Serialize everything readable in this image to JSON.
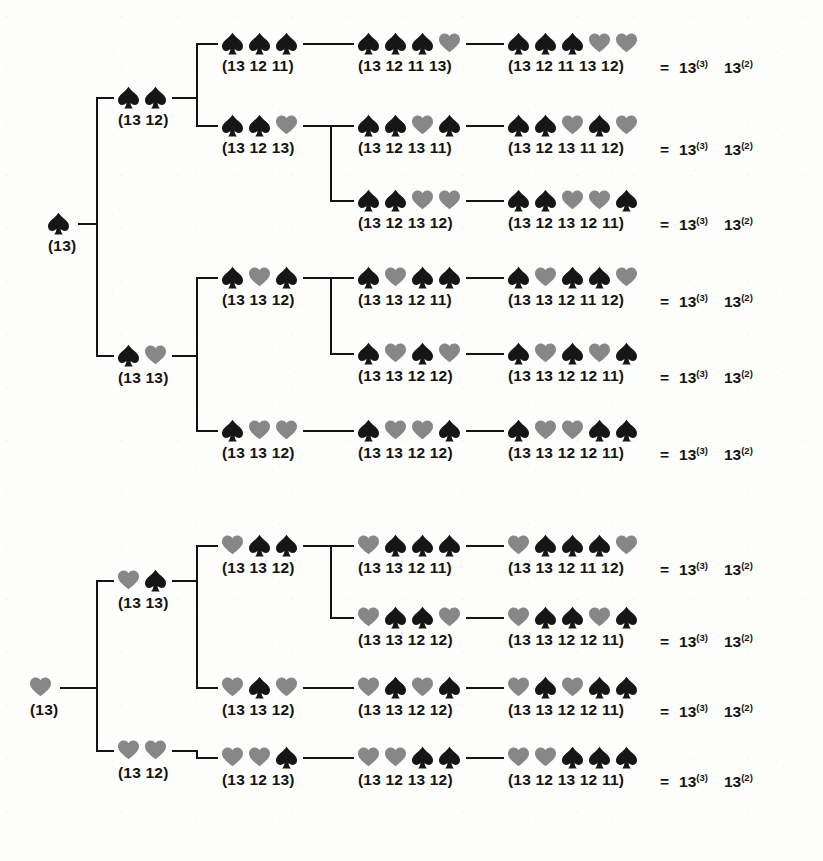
{
  "figure": {
    "kind": "combinatorial-enumeration-tree",
    "colors": {
      "spade": "#161616",
      "heart": "#878787",
      "line": "#141414",
      "background": "#fdfdfb"
    },
    "result_sign": "=",
    "result_terms": [
      "13(3)",
      "13(2)"
    ],
    "result_term_1_base": "13",
    "result_term_1_sup": "(3)",
    "result_term_2_base": "13",
    "result_term_2_sup": "(2)",
    "icons": {
      "spade": "spade-icon",
      "heart": "heart-icon"
    }
  },
  "trees": [
    {
      "id": "tree-spade-root",
      "root": {
        "suits": [
          "spade"
        ],
        "label": "(13)"
      },
      "rows": [
        {
          "level2": {
            "suits": [
              "spade",
              "spade"
            ],
            "label": "(13 12)"
          },
          "level3": {
            "suits": [
              "spade",
              "spade",
              "spade"
            ],
            "label": "(13 12 11)"
          },
          "level4": {
            "suits": [
              "spade",
              "spade",
              "spade",
              "heart"
            ],
            "label": "(13 12 11 13)"
          },
          "level5": {
            "suits": [
              "spade",
              "spade",
              "spade",
              "heart",
              "heart"
            ],
            "label": "(13 12 11 13 12)"
          }
        },
        {
          "level3": {
            "suits": [
              "spade",
              "spade",
              "heart"
            ],
            "label": "(13 12 13)"
          },
          "level4": {
            "suits": [
              "spade",
              "spade",
              "heart",
              "spade"
            ],
            "label": "(13 12 13 11)"
          },
          "level5": {
            "suits": [
              "spade",
              "spade",
              "heart",
              "spade",
              "heart"
            ],
            "label": "(13 12 13 11 12)"
          }
        },
        {
          "level4": {
            "suits": [
              "spade",
              "spade",
              "heart",
              "heart"
            ],
            "label": "(13 12 13 12)"
          },
          "level5": {
            "suits": [
              "spade",
              "spade",
              "heart",
              "heart",
              "spade"
            ],
            "label": "(13 12 13 12 11)"
          }
        },
        {
          "level2": {
            "suits": [
              "spade",
              "heart"
            ],
            "label": "(13 13)"
          },
          "level3": {
            "suits": [
              "spade",
              "heart",
              "spade"
            ],
            "label": "(13 13 12)"
          },
          "level4": {
            "suits": [
              "spade",
              "heart",
              "spade",
              "spade"
            ],
            "label": "(13 13 12 11)"
          },
          "level5": {
            "suits": [
              "spade",
              "heart",
              "spade",
              "spade",
              "heart"
            ],
            "label": "(13 13 12 11 12)"
          }
        },
        {
          "level4": {
            "suits": [
              "spade",
              "heart",
              "spade",
              "heart"
            ],
            "label": "(13 13 12 12)"
          },
          "level5": {
            "suits": [
              "spade",
              "heart",
              "spade",
              "heart",
              "spade"
            ],
            "label": "(13 13 12 12 11)"
          }
        },
        {
          "level3": {
            "suits": [
              "spade",
              "heart",
              "heart"
            ],
            "label": "(13 13 12)"
          },
          "level4": {
            "suits": [
              "spade",
              "heart",
              "heart",
              "spade"
            ],
            "label": "(13 13 12 12)"
          },
          "level5": {
            "suits": [
              "spade",
              "heart",
              "heart",
              "spade",
              "spade"
            ],
            "label": "(13 13 12 12 11)"
          }
        }
      ]
    },
    {
      "id": "tree-heart-root",
      "root": {
        "suits": [
          "heart"
        ],
        "label": "(13)"
      },
      "rows": [
        {
          "level2": {
            "suits": [
              "heart",
              "spade"
            ],
            "label": "(13 13)"
          },
          "level3": {
            "suits": [
              "heart",
              "spade",
              "spade"
            ],
            "label": "(13 13 12)"
          },
          "level4": {
            "suits": [
              "heart",
              "spade",
              "spade",
              "spade"
            ],
            "label": "(13 13 12 11)"
          },
          "level5": {
            "suits": [
              "heart",
              "spade",
              "spade",
              "spade",
              "heart"
            ],
            "label": "(13 13 12 11 12)"
          }
        },
        {
          "level4": {
            "suits": [
              "heart",
              "spade",
              "spade",
              "heart"
            ],
            "label": "(13 13 12 12)"
          },
          "level5": {
            "suits": [
              "heart",
              "spade",
              "spade",
              "heart",
              "spade"
            ],
            "label": "(13 13 12 12 11)"
          }
        },
        {
          "level3": {
            "suits": [
              "heart",
              "spade",
              "heart"
            ],
            "label": "(13 13 12)"
          },
          "level4": {
            "suits": [
              "heart",
              "spade",
              "heart",
              "spade"
            ],
            "label": "(13 13 12 12)"
          },
          "level5": {
            "suits": [
              "heart",
              "spade",
              "heart",
              "spade",
              "spade"
            ],
            "label": "(13 13 12 12 11)"
          }
        },
        {
          "level2": {
            "suits": [
              "heart",
              "heart"
            ],
            "label": "(13 12)"
          },
          "level3": {
            "suits": [
              "heart",
              "heart",
              "spade"
            ],
            "label": "(13 12 13)"
          },
          "level4": {
            "suits": [
              "heart",
              "heart",
              "spade",
              "spade"
            ],
            "label": "(13 12 13 12)"
          },
          "level5": {
            "suits": [
              "heart",
              "heart",
              "spade",
              "spade",
              "spade"
            ],
            "label": "(13 12 13 12 11)"
          }
        }
      ]
    }
  ]
}
